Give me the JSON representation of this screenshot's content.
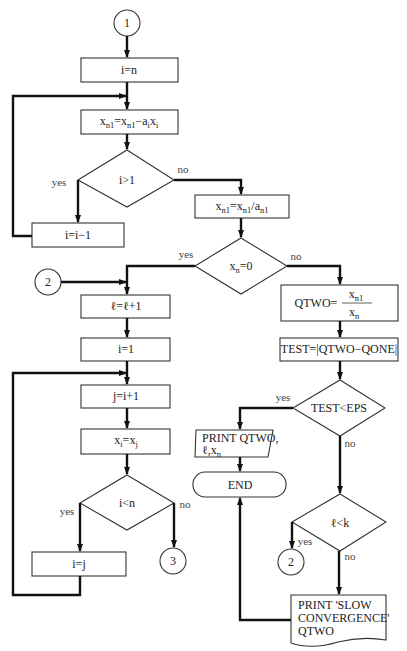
{
  "diagram": {
    "type": "flowchart",
    "connectors": {
      "c1_top": "1",
      "c2_left": "2",
      "c3": "3",
      "c2_right": "2"
    },
    "nodes": {
      "i_eq_n": "i=n",
      "xn1_update": {
        "x": "x",
        "s1": "n1",
        "eq": "=x",
        "s2": "n1",
        "minus": "−a",
        "s3": "i",
        "x2": "x",
        "s4": "i"
      },
      "i_gt_1": "i>1",
      "i_eq_i_minus_1": "i=i−1",
      "xn1_divide": {
        "x": "x",
        "s1": "n1",
        "eq": "=x",
        "s2": "n1",
        "slash": "/a",
        "s3": "n1"
      },
      "xn_eq_0": {
        "x": "x",
        "s": "n",
        "rest": "=0"
      },
      "l_inc": "ℓ=ℓ+1",
      "i_eq_1": "i=1",
      "j_eq_i_plus_1": "j=i+1",
      "xi_eq_xj": {
        "x": "x",
        "s1": "i",
        "eq": "=x",
        "s2": "j"
      },
      "i_lt_n": "i<n",
      "i_eq_j": "i=j",
      "qtwo": {
        "lhs": "QTWO=",
        "num_x": "x",
        "num_s": "n1",
        "den_x": "x",
        "den_s": "n"
      },
      "test_assign": "TEST=|QTWO−QONE|",
      "test_lt_eps": "TEST<EPS",
      "print_qtwo": {
        "line1": "PRINT QTWO,",
        "line2": "ℓ,x",
        "line2_sub": "n"
      },
      "end": "END",
      "l_lt_k": "ℓ<k",
      "print_slow": {
        "line1": "PRINT 'SLOW",
        "line2": "CONVERGENCE'",
        "line3": "QTWO"
      }
    },
    "branch_labels": {
      "i_gt_1_yes": "yes",
      "i_gt_1_no": "no",
      "xn_eq_0_yes": "yes",
      "xn_eq_0_no": "no",
      "i_lt_n_yes": "yes",
      "i_lt_n_no": "no",
      "test_yes": "yes",
      "test_no": "no",
      "l_lt_k_yes": "yes",
      "l_lt_k_no": "no"
    },
    "colors": {
      "line": "#111111",
      "background": "#ffffff"
    }
  }
}
